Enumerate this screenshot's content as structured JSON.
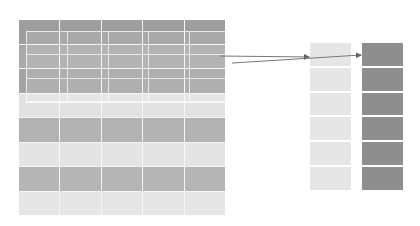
{
  "diagram": {
    "matrix": {
      "columns": 5,
      "rows": 8,
      "row_colors": [
        "#9e9e9e",
        "#a9a9a9",
        "#a4a4a4",
        "#e2e2e2",
        "#b3b3b3",
        "#e4e4e4",
        "#b5b5b5",
        "#e6e6e6"
      ]
    },
    "overlay_window": {
      "rows": 3,
      "columns": 5,
      "border_color": "#ffffff"
    },
    "stacks": [
      {
        "name": "light-stack",
        "cells": 6,
        "color": "#e6e6e6"
      },
      {
        "name": "dark-stack",
        "cells": 6,
        "color": "#8e8e8e"
      }
    ],
    "arrows": [
      {
        "from": [
          220,
          56
        ],
        "to": [
          309,
          57
        ],
        "color": "#777777"
      },
      {
        "from": [
          232,
          63
        ],
        "to": [
          361,
          55
        ],
        "color": "#777777"
      }
    ]
  }
}
